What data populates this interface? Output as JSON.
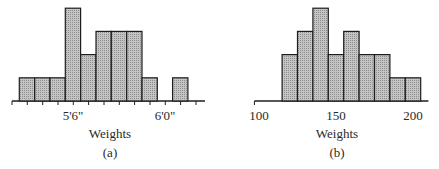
{
  "colors": {
    "bar_fill": "#b9b9b9",
    "bar_stroke": "#1e1e1e",
    "axis": "#1e1e1e"
  },
  "chart_data": [
    {
      "type": "bar",
      "panel": "(a)",
      "title": "",
      "xlabel": "Weights",
      "ylabel": "",
      "bin_width": "1 inch",
      "categories": [
        "5'3\"",
        "5'4\"",
        "5'5\"",
        "5'6\"",
        "5'7\"",
        "5'8\"",
        "5'9\"",
        "5'10\"",
        "5'11\"",
        "6'0\"",
        "6'1\""
      ],
      "values": [
        1,
        1,
        1,
        4,
        2,
        3,
        3,
        3,
        1,
        0,
        1
      ],
      "tick_labels": [
        "5'6\"",
        "6'0\""
      ],
      "grid": false
    },
    {
      "type": "bar",
      "panel": "(b)",
      "title": "",
      "xlabel": "Weights",
      "ylabel": "",
      "bin_width": 10,
      "bins": [
        [
          115,
          125
        ],
        [
          125,
          135
        ],
        [
          135,
          145
        ],
        [
          145,
          155
        ],
        [
          155,
          165
        ],
        [
          165,
          175
        ],
        [
          175,
          185
        ],
        [
          185,
          195
        ],
        [
          195,
          205
        ]
      ],
      "categories": [
        "120",
        "130",
        "140",
        "150",
        "160",
        "170",
        "180",
        "190",
        "200"
      ],
      "values": [
        2,
        3,
        4,
        2,
        3,
        2,
        2,
        1,
        1
      ],
      "tick_labels": [
        "100",
        "150",
        "200"
      ],
      "xlim": [
        95,
        210
      ],
      "grid": false
    }
  ],
  "panels": {
    "a": {
      "xlabel": "Weights",
      "caption": "(a)",
      "tick_left": "5'6\"",
      "tick_right": "6'0\""
    },
    "b": {
      "xlabel": "Weights",
      "caption": "(b)",
      "tick_100": "100",
      "tick_150": "150",
      "tick_200": "200"
    }
  }
}
